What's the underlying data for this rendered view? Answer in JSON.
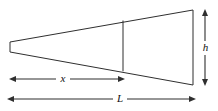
{
  "figure": {
    "type": "geometry-diagram",
    "background_color": "#ffffff",
    "stroke_color": "#2f2f2f",
    "label_color": "#111111",
    "canvas": {
      "width": 218,
      "height": 111
    }
  },
  "shape": {
    "name": "wedge-outline",
    "vertices": {
      "tip_top": {
        "x": 10,
        "y": 42
      },
      "tip_bottom": {
        "x": 10,
        "y": 52
      },
      "base_top": {
        "x": 193,
        "y": 10
      },
      "base_bottom": {
        "x": 193,
        "y": 85
      }
    },
    "divider": {
      "name": "interior-section-line",
      "x": 123,
      "y_top": 20.5,
      "y_bottom": 71.3
    }
  },
  "dimensions": [
    {
      "id": "h",
      "label": "h",
      "orientation": "vertical",
      "axis_position": 205,
      "start": 10,
      "end": 85,
      "label_offset": 48,
      "arrowheads": "both"
    },
    {
      "id": "x",
      "label": "x",
      "orientation": "horizontal",
      "axis_position": 79,
      "start": 10,
      "end": 124,
      "label_offset": 63,
      "arrowheads": "both"
    },
    {
      "id": "L",
      "label": "L",
      "orientation": "horizontal",
      "axis_position": 99,
      "start": 8,
      "end": 195,
      "label_offset": 120,
      "arrowheads": "both"
    }
  ],
  "labels": {
    "h": "h",
    "x": "x",
    "L": "L"
  }
}
